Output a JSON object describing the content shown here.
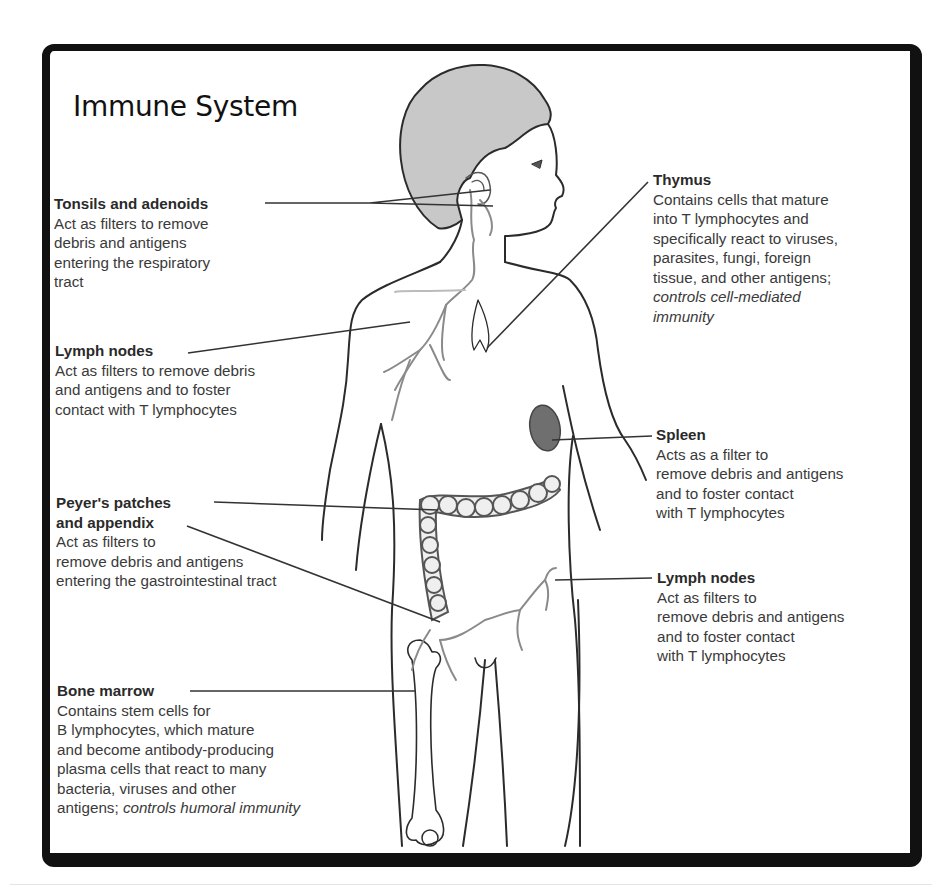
{
  "title": "Immune System",
  "labels": {
    "tonsils": {
      "heading": "Tonsils and adenoids",
      "body": "Act as filters to remove\ndebris and antigens\nentering the respiratory\ntract"
    },
    "lymph_left": {
      "heading": "Lymph nodes",
      "body": "Act as filters to remove debris\nand antigens and to foster\ncontact with T lymphocytes"
    },
    "peyers": {
      "heading": "Peyer's patches",
      "heading2": "and appendix",
      "body": "Act as filters to\nremove debris and antigens\nentering the gastrointestinal tract"
    },
    "bone_marrow": {
      "heading": "Bone marrow",
      "body": "Contains stem cells for\nB lymphocytes, which mature\nand become antibody-producing\nplasma cells that react to many\nbacteria, viruses and other\nantigens; ",
      "body_italic": "controls humoral immunity"
    },
    "thymus": {
      "heading": "Thymus",
      "body": "Contains cells that mature\ninto T lymphocytes and\nspecifically react to viruses,\nparasites, fungi, foreign\ntissue, and other antigens;",
      "body_italic": "controls cell-mediated\nimmunity"
    },
    "spleen": {
      "heading": "Spleen",
      "body": "Acts as a filter to\nremove debris and antigens\nand to foster contact\nwith T lymphocytes"
    },
    "lymph_right": {
      "heading": "Lymph nodes",
      "body": "Act as filters to\nremove debris and antigens\nand to foster contact\nwith T lymphocytes"
    }
  },
  "colors": {
    "frame": "#111111",
    "hair": "#c8c8c8",
    "outline": "#2b2b2b",
    "lymph": "#8a8a8a",
    "spleen": "#777777",
    "text": "#3a3a3a"
  }
}
